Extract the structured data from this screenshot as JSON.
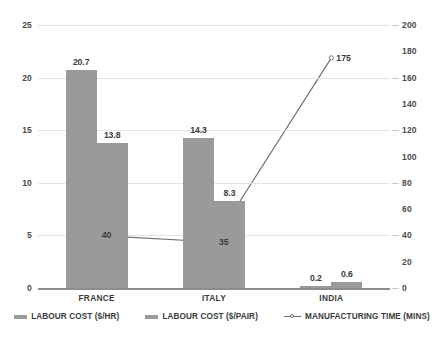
{
  "chart_data": {
    "type": "bar",
    "title": "",
    "subtitle": "",
    "xlabel": "",
    "ylabel": "",
    "categories": [
      "FRANCE",
      "ITALY",
      "INDIA"
    ],
    "series": [
      {
        "name": "LABOUR COST ($/HR)",
        "type": "bar",
        "axis": "left",
        "values": [
          20.7,
          14.3,
          0.2
        ],
        "labels": [
          "20.7",
          "14.3",
          "0.2"
        ],
        "color": "#9a9a9a"
      },
      {
        "name": "LABOUR COST ($/PAIR)",
        "type": "bar",
        "axis": "left",
        "values": [
          13.8,
          8.3,
          0.6
        ],
        "labels": [
          "13.8",
          "8.3",
          "0.6"
        ],
        "color": "#9a9a9a"
      },
      {
        "name": "MANUFACTURING TIME (MINS)",
        "type": "line",
        "axis": "right",
        "values": [
          40,
          35,
          175
        ],
        "labels": [
          "40",
          "35",
          "175"
        ],
        "color": "#6f6f6f"
      }
    ],
    "left_axis": {
      "min": 0,
      "max": 25,
      "ticks": [
        "0",
        "5",
        "10",
        "15",
        "20",
        "25"
      ],
      "tick_values": [
        0,
        5,
        10,
        15,
        20,
        25
      ]
    },
    "right_axis": {
      "min": 0,
      "max": 200,
      "ticks": [
        "0",
        "20",
        "40",
        "60",
        "80",
        "100",
        "120",
        "140",
        "160",
        "180",
        "200"
      ],
      "tick_values": [
        0,
        20,
        40,
        60,
        80,
        100,
        120,
        140,
        160,
        180,
        200
      ]
    },
    "grid": true,
    "legend_position": "bottom",
    "background_color": "#ffffff",
    "grid_color": "#e4e4e4",
    "axis_color": "#8d8d8d"
  },
  "legend": {
    "items": [
      {
        "label": "LABOUR COST ($/HR)",
        "marker": "bar-swatch-icon"
      },
      {
        "label": "LABOUR COST ($/PAIR)",
        "marker": "bar-swatch-icon"
      },
      {
        "label": "MANUFACTURING TIME (MINS)",
        "marker": "line-marker-icon"
      }
    ]
  }
}
